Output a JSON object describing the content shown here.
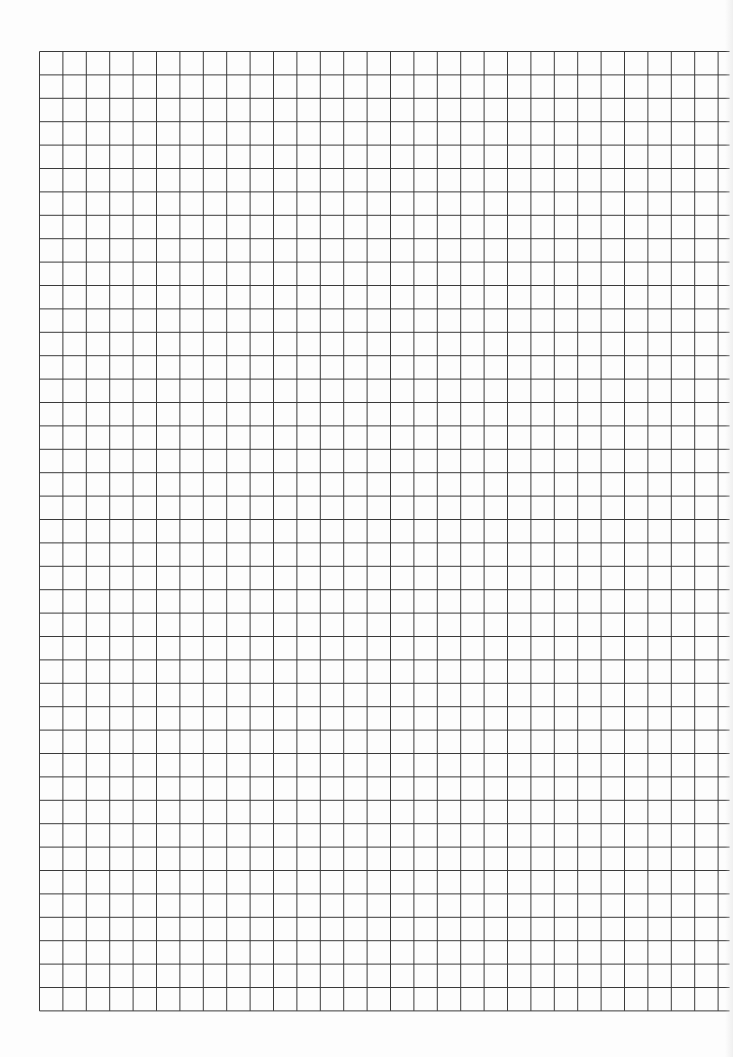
{
  "page": {
    "type": "graph-paper",
    "background_color": "#fdfdfd",
    "line_color": "#3a3a3a"
  },
  "grid": {
    "left": 39,
    "top": 51,
    "columns": 29,
    "rows": 41,
    "cell_size": 23.4,
    "horizontal_overhang_right": 12
  }
}
